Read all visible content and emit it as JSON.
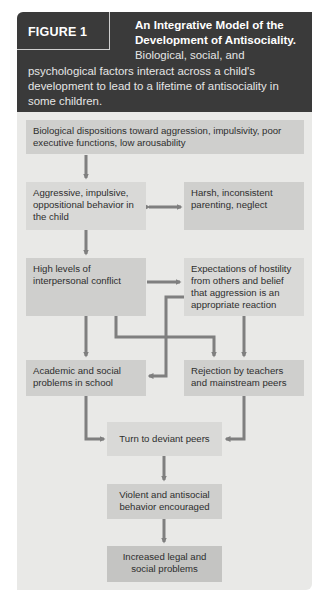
{
  "figure": {
    "label": "FIGURE 1",
    "title": "An Integrative Model of the Development of Antisociality.",
    "description_line1": "Biological, social, and",
    "description_rest": "psychological factors interact across a child's development to lead to a lifetime of antisociality in some children."
  },
  "nodes": [
    {
      "id": "biological",
      "label": "Biological dispositions toward aggression, impulsivity, poor executive functions, low arousability"
    },
    {
      "id": "aggressive",
      "label": "Aggressive, impulsive, oppositional behavior in the child"
    },
    {
      "id": "harsh",
      "label": "Harsh, inconsistent parenting, neglect"
    },
    {
      "id": "conflict",
      "label": "High levels of interpersonal conflict"
    },
    {
      "id": "expectations",
      "label": "Expectations of hostility from others and belief that aggression is an appropriate reaction"
    },
    {
      "id": "academic",
      "label": "Academic and social problems in school"
    },
    {
      "id": "rejection",
      "label": "Rejection by teachers and mainstream peers"
    },
    {
      "id": "deviant",
      "label": "Turn to deviant peers"
    },
    {
      "id": "violent",
      "label": "Violent and antisocial behavior encouraged"
    },
    {
      "id": "legal",
      "label": "Increased legal and social problems"
    }
  ],
  "edges": [
    {
      "from": "biological",
      "to": "aggressive"
    },
    {
      "from": "aggressive",
      "to": "harsh",
      "bidirectional": true
    },
    {
      "from": "aggressive",
      "to": "conflict"
    },
    {
      "from": "conflict",
      "to": "expectations"
    },
    {
      "from": "conflict",
      "to": "academic"
    },
    {
      "from": "conflict",
      "to": "rejection"
    },
    {
      "from": "expectations",
      "to": "academic"
    },
    {
      "from": "expectations",
      "to": "rejection"
    },
    {
      "from": "academic",
      "to": "deviant"
    },
    {
      "from": "rejection",
      "to": "deviant"
    },
    {
      "from": "deviant",
      "to": "violent"
    },
    {
      "from": "violent",
      "to": "legal"
    }
  ],
  "colors": {
    "header_bg": "#3a3a3a",
    "panel_bg": "#e9e9e7",
    "box_light": "#d9d9d7",
    "box_mid": "#cfcfcd",
    "box_dark": "#c4c4c2",
    "arrow": "#7f7f7f"
  }
}
